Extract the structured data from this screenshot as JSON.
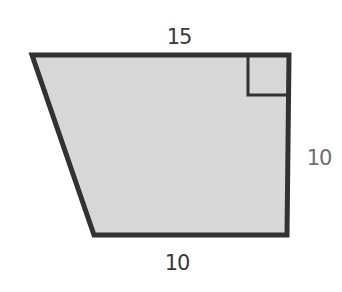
{
  "diagram": {
    "shape": "right trapezoid",
    "colors": {
      "fill": "#d7d7d7",
      "stroke": "#323232",
      "label_dark": "#3a3a3a",
      "label_light": "#6e6e6e"
    },
    "labels": {
      "top": "15",
      "right": "10",
      "bottom": "10"
    },
    "right_angle_marker": "top-right corner"
  }
}
